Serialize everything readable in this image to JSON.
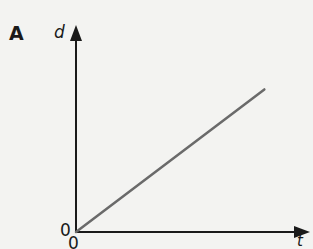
{
  "panel": {
    "label": "A"
  },
  "chart_data": {
    "type": "line",
    "title": "",
    "xlabel": "t",
    "ylabel": "d",
    "x_tick_labels": [
      "0"
    ],
    "y_tick_labels": [
      "0"
    ],
    "grid": false,
    "legend": null,
    "series": [
      {
        "name": "d vs t",
        "x": [
          0,
          1
        ],
        "y": [
          0,
          0.83
        ],
        "color": "#6a6a6a"
      }
    ],
    "xlim": [
      0,
      1.2
    ],
    "ylim": [
      0,
      1.1
    ],
    "note": "Straight line through origin: distance increases linearly with time (constant speed)"
  },
  "colors": {
    "axis": "#1a1a1a",
    "line": "#6a6a6a",
    "background": "#f3f3f1"
  }
}
